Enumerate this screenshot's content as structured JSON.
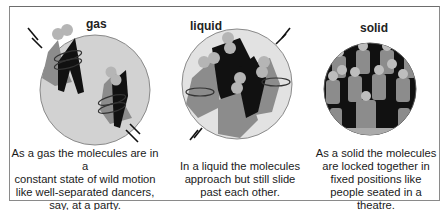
{
  "colors": {
    "frame": "#8a8a8a",
    "gas_circle": "#d2d2d2",
    "liquid_circle": "#e2e2e2",
    "solid_background": "#111111",
    "figure_gray": "#8c8c8c",
    "figure_dark": "#111111",
    "head": "#b5b5b5"
  },
  "panels": [
    {
      "state": "gas",
      "label": "gas",
      "caption": "As a gas the molecules are in a constant state of wild motion like well-separated dancers, say, at a party.",
      "caption_lines": [
        "As a gas the molecules are in a",
        "constant state of wild motion",
        "like well-separated dancers,",
        "say, at a party."
      ]
    },
    {
      "state": "liquid",
      "label": "liquid",
      "caption": "In a liquid the molecules approach but still slide past each other.",
      "caption_lines": [
        "In a liquid the molecules",
        "approach but still slide",
        "past each other."
      ]
    },
    {
      "state": "solid",
      "label": "solid",
      "caption": "As a solid the molecules are locked together in fixed positions like people seated in a theatre.",
      "caption_lines": [
        "As a solid the molecules",
        "are locked together in",
        "fixed positions like",
        "people seated in a theatre."
      ]
    }
  ]
}
